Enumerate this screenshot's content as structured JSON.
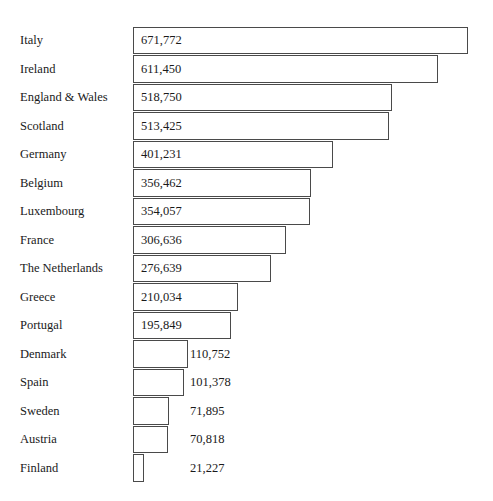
{
  "chart_data": {
    "type": "bar",
    "orientation": "horizontal",
    "title": "",
    "subtitle": "",
    "xlabel": "",
    "ylabel": "",
    "grid": false,
    "legend": null,
    "axis_visible": false,
    "tick_labels": [],
    "xlim": [
      0,
      671772
    ],
    "value_format": "thousands-separated",
    "categories": [
      "Italy",
      "Ireland",
      "England & Wales",
      "Scotland",
      "Germany",
      "Belgium",
      "Luxembourg",
      "France",
      "The Netherlands",
      "Greece",
      "Portugal",
      "Denmark",
      "Spain",
      "Sweden",
      "Austria",
      "Finland"
    ],
    "values": [
      671772,
      611450,
      518750,
      513425,
      401231,
      356462,
      354057,
      306636,
      276639,
      210034,
      195849,
      110752,
      101378,
      71895,
      70818,
      21227
    ],
    "value_labels": [
      "671,772",
      "611,450",
      "518,750",
      "513,425",
      "401,231",
      "356,462",
      "354,057",
      "306,636",
      "276,639",
      "210,034",
      "195,849",
      "110,752",
      "101,378",
      "71,895",
      "70,818",
      "21,227"
    ],
    "label_placement": [
      "inside",
      "inside",
      "inside",
      "inside",
      "inside",
      "inside",
      "inside",
      "inside",
      "inside",
      "inside",
      "inside",
      "outside",
      "outside",
      "outside",
      "outside",
      "outside"
    ],
    "colors": {
      "bar_fill": "#ffffff",
      "bar_border": "#4a4a4a",
      "text": "#1a1a1a",
      "background": "#ffffff"
    }
  }
}
